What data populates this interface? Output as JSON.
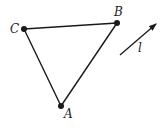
{
  "diagram": {
    "type": "geometry-triangle-with-vector",
    "colors": {
      "stroke": "#1a1a1a",
      "background": "#ffffff"
    },
    "points": [
      {
        "id": "C",
        "label": "C",
        "x": 24,
        "y": 29,
        "label_x": 10,
        "label_y": 33
      },
      {
        "id": "B",
        "label": "B",
        "x": 117,
        "y": 23,
        "label_x": 114,
        "label_y": 16
      },
      {
        "id": "A",
        "label": "A",
        "x": 61,
        "y": 106,
        "label_x": 64,
        "label_y": 118
      }
    ],
    "segments": [
      {
        "from": "C",
        "to": "B"
      },
      {
        "from": "B",
        "to": "A"
      },
      {
        "from": "A",
        "to": "C"
      }
    ],
    "vector": {
      "label": "l",
      "x1": 120,
      "y1": 55,
      "x2": 156,
      "y2": 24,
      "label_x": 138,
      "label_y": 52
    }
  }
}
